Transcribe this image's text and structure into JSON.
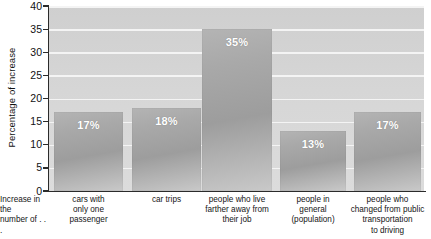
{
  "chart_data": {
    "type": "bar",
    "title": "",
    "xlabel": "Increase in the number of . . .",
    "ylabel": "Percentage of increase",
    "ylim": [
      0,
      40
    ],
    "ytick_step": 5,
    "yticks": [
      "0",
      "5",
      "10",
      "15",
      "20",
      "25",
      "30",
      "35",
      "40"
    ],
    "grid": "horizontal",
    "legend": "none",
    "categories": [
      "cars with only one passenger",
      "car trips",
      "people who live farther away from their job",
      "people in general (population)",
      "people who changed from public transportation to driving"
    ],
    "category_lines": [
      [
        "cars with",
        "only one",
        "passenger"
      ],
      [
        "car trips"
      ],
      [
        "people who live",
        "farther away from",
        "their job"
      ],
      [
        "people in",
        "general",
        "(population)"
      ],
      [
        "people who",
        "changed from public",
        "transportation",
        "to driving"
      ]
    ],
    "values": [
      17,
      18,
      35,
      13,
      17
    ],
    "data_labels": [
      "17%",
      "18%",
      "35%",
      "13%",
      "17%"
    ]
  },
  "axis": {
    "y_title": "Percentage of increase",
    "x_note_line1": "Increase in the",
    "x_note_line2": "number of . . ."
  },
  "colors": {
    "plot_background": "#d6d6d6",
    "gridline": "#f4f4f4",
    "bar_light": "#b4b4b4",
    "bar_dark": "#9d9d9d",
    "axis": "#2b2b2b",
    "value_label": "#ffffff",
    "text": "#151515"
  }
}
